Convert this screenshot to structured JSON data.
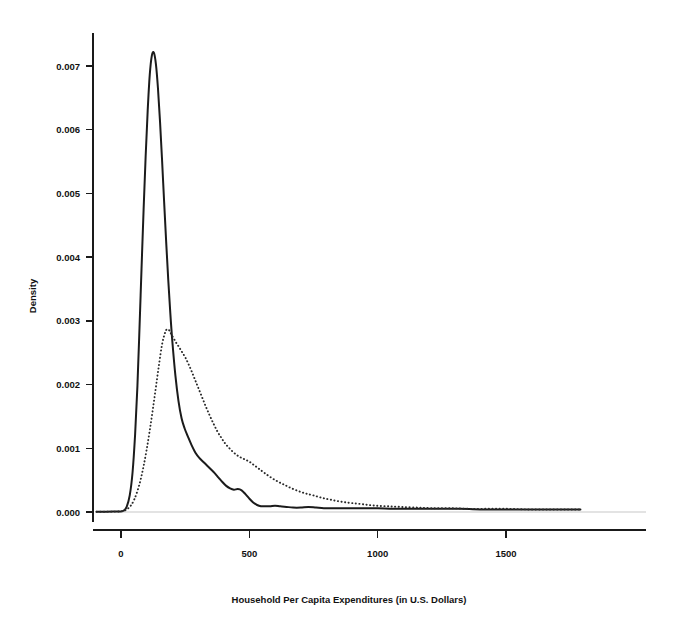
{
  "chart_data": {
    "type": "line",
    "title": "",
    "subtitle": "",
    "xlabel": "Household Per Capita Expenditures (in U.S. Dollars)",
    "ylabel": "Density",
    "xlim": [
      -110,
      1800
    ],
    "ylim": [
      -0.00028,
      0.0078
    ],
    "xticks": [
      0,
      500,
      1000,
      1500
    ],
    "xtick_labels": [
      "0",
      "500",
      "1000",
      "1500"
    ],
    "yticks": [
      0.0,
      0.001,
      0.002,
      0.003,
      0.004,
      0.005,
      0.006,
      0.007
    ],
    "ytick_labels": [
      "0.000",
      "0.001",
      "0.002",
      "0.003",
      "0.004",
      "0.005",
      "0.006",
      "0.007"
    ],
    "grid": false,
    "legend": "none",
    "annotations": [],
    "series": [
      {
        "name": "solid-density",
        "style": "solid",
        "color": "#1b1b1b",
        "x": [
          -95,
          -60,
          -30,
          -5,
          10,
          22,
          34,
          45,
          55,
          64,
          72,
          80,
          88,
          96,
          104,
          112,
          120,
          128,
          136,
          144,
          152,
          160,
          168,
          176,
          184,
          192,
          200,
          212,
          224,
          236,
          248,
          260,
          275,
          290,
          305,
          320,
          335,
          350,
          365,
          380,
          395,
          410,
          425,
          440,
          455,
          470,
          485,
          500,
          515,
          530,
          545,
          560,
          580,
          600,
          620,
          645,
          670,
          700,
          730,
          760,
          790,
          820,
          860,
          900,
          950,
          1000,
          1060,
          1120,
          1180,
          1250,
          1320,
          1400,
          1480,
          1560,
          1640,
          1720,
          1790
        ],
        "y": [
          4e-06,
          5e-06,
          6e-06,
          8e-06,
          2e-05,
          8e-05,
          0.00026,
          0.00062,
          0.00122,
          0.00198,
          0.00288,
          0.00382,
          0.00474,
          0.00558,
          0.0063,
          0.00686,
          0.00716,
          0.00721,
          0.00703,
          0.00665,
          0.00613,
          0.00552,
          0.00487,
          0.00424,
          0.00365,
          0.00313,
          0.00268,
          0.00214,
          0.00174,
          0.00147,
          0.00131,
          0.00119,
          0.00105,
          0.00093,
          0.00085,
          0.00079,
          0.00073,
          0.00067,
          0.00061,
          0.00054,
          0.00047,
          0.00041,
          0.00037,
          0.00035,
          0.00036,
          0.00034,
          0.00028,
          0.00021,
          0.00015,
          0.00011,
          9e-05,
          9e-05,
          9e-05,
          0.0001,
          9e-05,
          8e-05,
          7e-05,
          7e-05,
          8e-05,
          7e-05,
          6e-05,
          6e-05,
          6e-05,
          6e-05,
          6e-05,
          6e-05,
          5e-05,
          5e-05,
          5e-05,
          5e-05,
          5e-05,
          4e-05,
          4e-05,
          4e-05,
          4e-05,
          4e-05,
          4e-05
        ]
      },
      {
        "name": "dotted-density",
        "style": "dotted",
        "color": "#2a2a2a",
        "x": [
          -95,
          -60,
          -30,
          -5,
          12,
          26,
          40,
          52,
          64,
          76,
          88,
          100,
          112,
          124,
          136,
          148,
          160,
          172,
          180,
          188,
          196,
          206,
          216,
          226,
          238,
          250,
          262,
          275,
          288,
          300,
          315,
          330,
          345,
          360,
          375,
          390,
          405,
          420,
          440,
          460,
          480,
          500,
          520,
          540,
          560,
          585,
          610,
          635,
          660,
          690,
          720,
          750,
          785,
          820,
          860,
          900,
          945,
          990,
          1040,
          1090,
          1150,
          1210,
          1280,
          1350,
          1430,
          1510,
          1590,
          1670,
          1740,
          1790
        ],
        "y": [
          4e-06,
          5e-06,
          6e-06,
          8e-06,
          2e-05,
          5e-05,
          0.00011,
          0.0002,
          0.00033,
          0.0005,
          0.00072,
          0.00098,
          0.00128,
          0.00161,
          0.00196,
          0.00231,
          0.00263,
          0.00282,
          0.00287,
          0.00285,
          0.00279,
          0.00272,
          0.00265,
          0.00259,
          0.00251,
          0.00243,
          0.00233,
          0.00221,
          0.00208,
          0.00196,
          0.00181,
          0.00166,
          0.00152,
          0.00139,
          0.00127,
          0.00117,
          0.00108,
          0.00101,
          0.00093,
          0.00087,
          0.00083,
          0.00079,
          0.00073,
          0.00067,
          0.00061,
          0.00054,
          0.00048,
          0.00043,
          0.00038,
          0.00033,
          0.00029,
          0.00026,
          0.00022,
          0.00019,
          0.00016,
          0.00014,
          0.00012,
          0.0001,
          9e-05,
          8e-05,
          7e-05,
          6e-05,
          6e-05,
          5e-05,
          5e-05,
          5e-05,
          4e-05,
          4e-05,
          4e-05,
          4e-05
        ]
      }
    ]
  }
}
